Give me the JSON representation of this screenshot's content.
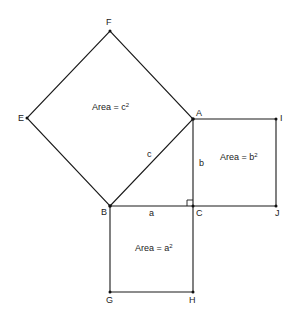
{
  "diagram": {
    "points": {
      "A": {
        "label": "A",
        "x": 193,
        "y": 119
      },
      "B": {
        "label": "B",
        "x": 110,
        "y": 206
      },
      "C": {
        "label": "C",
        "x": 193,
        "y": 206
      },
      "E": {
        "label": "E",
        "x": 27,
        "y": 118
      },
      "F": {
        "label": "F",
        "x": 110,
        "y": 31
      },
      "G": {
        "label": "G",
        "x": 110,
        "y": 292
      },
      "H": {
        "label": "H",
        "x": 193,
        "y": 292
      },
      "I": {
        "label": "I",
        "x": 276,
        "y": 119
      },
      "J": {
        "label": "J",
        "x": 276,
        "y": 206
      }
    },
    "sides": {
      "a": "a",
      "b": "b",
      "c": "c"
    },
    "areas": {
      "c_square": {
        "prefix": "Area = c",
        "exp": "2"
      },
      "b_square": {
        "prefix": "Area = b",
        "exp": "2"
      },
      "a_square": {
        "prefix": "Area = a",
        "exp": "2"
      }
    },
    "colors": {
      "line": "#1a1a1a",
      "text": "#222222",
      "background": "#ffffff"
    }
  }
}
